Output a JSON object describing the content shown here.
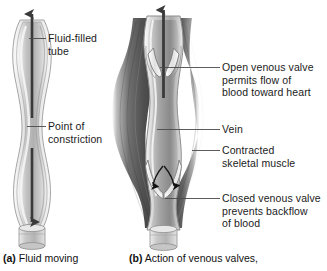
{
  "figure": {
    "background_color": "#ffffff",
    "text_color": "#1b1b1b"
  },
  "panel_a": {
    "id": "a",
    "caption_marker": "(a)",
    "caption_text": "Fluid moving",
    "labels": [
      {
        "id": "fluid-filled-tube",
        "line1": "Fluid-filled",
        "line2": "tube"
      },
      {
        "id": "point-of-constriction",
        "line1": "Point of",
        "line2": "constriction"
      }
    ],
    "arrows": [
      {
        "id": "upward-flow-arrow",
        "direction": "up",
        "color": "#3a3a3a"
      },
      {
        "id": "downward-flow-arrow",
        "direction": "down",
        "color": "#3a3a3a"
      }
    ],
    "structures": [
      {
        "id": "tube",
        "name": "fluid-filled-tube",
        "color": "#c9c9c9"
      },
      {
        "id": "constriction",
        "name": "point-of-constriction",
        "color": "#b5b5b5"
      },
      {
        "id": "base-cuff",
        "name": "tube-base-cuff",
        "color": "#bdbdbd"
      }
    ]
  },
  "panel_b": {
    "id": "b",
    "caption_marker": "(b)",
    "caption_text": "Action of venous valves,",
    "labels": [
      {
        "id": "open-venous-valve",
        "line1": "Open venous valve",
        "line2": "permits flow of",
        "line3": "blood toward heart"
      },
      {
        "id": "vein",
        "line1": "Vein"
      },
      {
        "id": "contracted-skeletal-muscle",
        "line1": "Contracted",
        "line2": "skeletal muscle"
      },
      {
        "id": "closed-venous-valve",
        "line1": "Closed venous valve",
        "line2": "prevents backflow",
        "line3": "of blood"
      }
    ],
    "arrows": [
      {
        "id": "upward-blood-flow-arrow",
        "direction": "up",
        "color": "#3a3a3a"
      },
      {
        "id": "backflow-arrow-left",
        "direction": "down",
        "color": "#1a1a1a"
      },
      {
        "id": "backflow-arrow-right",
        "direction": "down",
        "color": "#1a1a1a"
      }
    ],
    "structures": [
      {
        "id": "vein-lumen",
        "name": "vein",
        "color": "#c4c4c4"
      },
      {
        "id": "muscle-left",
        "name": "contracted-skeletal-muscle-left",
        "color": "#4c4c4c"
      },
      {
        "id": "muscle-right",
        "name": "contracted-skeletal-muscle-right",
        "color": "#4c4c4c"
      },
      {
        "id": "valve-open",
        "name": "open-venous-valve-leaflets",
        "color": "#d8d8d8"
      },
      {
        "id": "valve-closed",
        "name": "closed-venous-valve-leaflets",
        "color": "#d0d0d0"
      },
      {
        "id": "vein-base-cuff",
        "name": "vein-base-cuff",
        "color": "#bdbdbd"
      }
    ]
  },
  "leader_lines": [
    {
      "id": "leader-fluid-filled-tube",
      "from": "tube",
      "to": "fluid-filled-tube"
    },
    {
      "id": "leader-point-of-constriction",
      "from": "constriction",
      "to": "point-of-constriction"
    },
    {
      "id": "leader-open-venous-valve",
      "from": "valve-open",
      "to": "open-venous-valve"
    },
    {
      "id": "leader-vein",
      "from": "vein-lumen",
      "to": "vein"
    },
    {
      "id": "leader-contracted-skeletal-muscle",
      "from": "muscle-right",
      "to": "contracted-skeletal-muscle"
    },
    {
      "id": "leader-closed-venous-valve",
      "from": "valve-closed",
      "to": "closed-venous-valve"
    }
  ]
}
